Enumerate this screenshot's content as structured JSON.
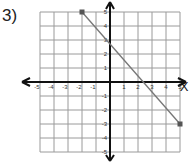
{
  "problem": {
    "label": "3)"
  },
  "axes": {
    "x_label": "X",
    "y_label": "Y",
    "x_ticks": [
      "-5",
      "-4",
      "-3",
      "-2",
      "-1",
      "1",
      "2",
      "3",
      "4",
      "5"
    ],
    "y_ticks": [
      "5",
      "4",
      "3",
      "2",
      "1",
      "-1",
      "-2",
      "-3",
      "-4",
      "-5"
    ]
  },
  "chart_data": {
    "type": "line",
    "title": "",
    "xlabel": "X",
    "ylabel": "Y",
    "xlim": [
      -5,
      5
    ],
    "ylim": [
      -5,
      5
    ],
    "grid": true,
    "series": [
      {
        "name": "segment",
        "x": [
          -2,
          5
        ],
        "y": [
          5,
          -3
        ],
        "endpoints": [
          [
            -2,
            5
          ],
          [
            5,
            -3
          ]
        ]
      }
    ]
  },
  "colors": {
    "grid": "#9a9a9a",
    "axis": "#111111",
    "line": "#777777",
    "point": "#555555"
  }
}
